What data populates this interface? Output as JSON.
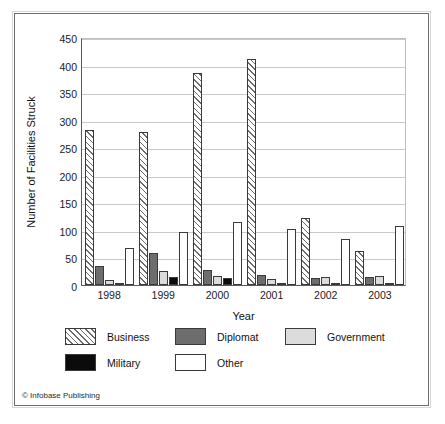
{
  "figure": {
    "credit": "© Infobase Publishing"
  },
  "chart_data": {
    "type": "bar",
    "title": "",
    "subtitle": "",
    "xlabel": "Year",
    "ylabel": "Number of Facilities Struck",
    "categories": [
      "1998",
      "1999",
      "2000",
      "2001",
      "2002",
      "2003"
    ],
    "ylim": [
      0,
      450
    ],
    "yticks": [
      0,
      50,
      100,
      150,
      200,
      250,
      300,
      350,
      400,
      450
    ],
    "ytick_labels": [
      "0",
      "50",
      "100",
      "150",
      "200",
      "250",
      "300",
      "350",
      "400",
      "450"
    ],
    "grid": true,
    "grid_axis": "y",
    "legend_position": "below",
    "series": [
      {
        "name": "Business",
        "fill": "diagonal-hatch",
        "color": "#ffffff",
        "values": [
          282,
          278,
          384,
          410,
          122,
          61
        ]
      },
      {
        "name": "Diplomat",
        "fill": "solid-dark-gray",
        "color": "#6d6d6d",
        "values": [
          34,
          59,
          28,
          18,
          13,
          14
        ]
      },
      {
        "name": "Government",
        "fill": "solid-light-gray",
        "color": "#dcdcdc",
        "values": [
          9,
          25,
          16,
          11,
          15,
          16
        ]
      },
      {
        "name": "Military",
        "fill": "solid-black",
        "color": "#0b0b0b",
        "values": [
          2,
          14,
          12,
          3,
          1,
          2
        ]
      },
      {
        "name": "Other",
        "fill": "fine-dots",
        "color": "#ffffff",
        "values": [
          67,
          96,
          114,
          101,
          83,
          107
        ]
      }
    ]
  }
}
